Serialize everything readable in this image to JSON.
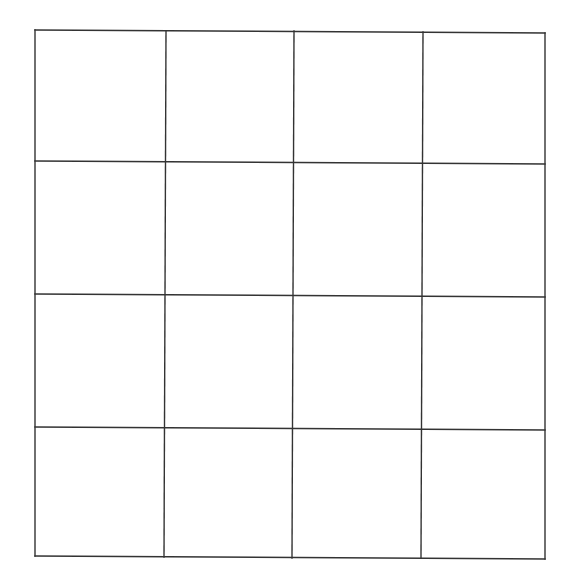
{
  "diagram": {
    "type": "grid",
    "rows": 4,
    "columns": 4,
    "stroke_color": "#333333",
    "background": "#ffffff",
    "horizontal_lines": [
      {
        "x1": 35,
        "y1": 30,
        "x2": 545,
        "y2": 33
      },
      {
        "x1": 35,
        "y1": 161,
        "x2": 545,
        "y2": 164
      },
      {
        "x1": 35,
        "y1": 294,
        "x2": 545,
        "y2": 297
      },
      {
        "x1": 35,
        "y1": 427,
        "x2": 545,
        "y2": 430
      },
      {
        "x1": 35,
        "y1": 556,
        "x2": 545,
        "y2": 559
      }
    ],
    "vertical_lines": [
      {
        "x1": 35,
        "y1": 30,
        "x2": 35,
        "y2": 556
      },
      {
        "x1": 166,
        "y1": 31,
        "x2": 164,
        "y2": 557
      },
      {
        "x1": 294,
        "y1": 31,
        "x2": 292,
        "y2": 558
      },
      {
        "x1": 423,
        "y1": 32,
        "x2": 421,
        "y2": 558
      },
      {
        "x1": 545,
        "y1": 33,
        "x2": 545,
        "y2": 559
      }
    ]
  }
}
